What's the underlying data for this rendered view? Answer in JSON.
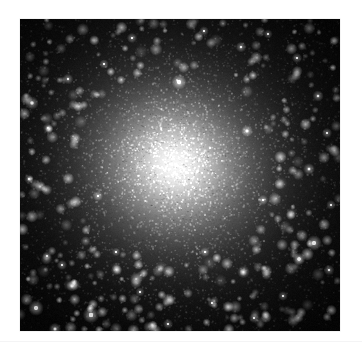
{
  "page": {
    "width": 362,
    "height": 353,
    "background_color": "#ffffff",
    "has_text": false,
    "has_axes": false,
    "has_border": false,
    "content_type": "astronomical-photograph"
  },
  "seam": {
    "y": 341,
    "color": "#f4f4f5"
  },
  "image_panel": {
    "name": "globular-cluster-image",
    "x": 20,
    "y": 19,
    "width": 320,
    "height": 312,
    "background_color": "#000000",
    "frame_color": "#e9e9ea"
  },
  "chart_data": {
    "type": "heatmap",
    "title": "",
    "subtitle": "",
    "xlabel": "",
    "ylabel": "",
    "legend": [],
    "grid": false,
    "colormap": "grayscale",
    "value_range": [
      0,
      255
    ],
    "cluster": {
      "center_x": 175,
      "center_y": 165,
      "core_radius_px": 22,
      "core_peak_value": 250,
      "halo_radius_px": 120,
      "background_value": 6,
      "ellipticity": 0.92,
      "position_angle_deg": 20,
      "profile": "king-like radial falloff",
      "radial_profile": {
        "radius_px": [
          0,
          10,
          20,
          30,
          45,
          60,
          80,
          100,
          125,
          150,
          180,
          220
        ],
        "brightness": [
          250,
          244,
          228,
          200,
          158,
          120,
          80,
          52,
          32,
          20,
          12,
          6
        ]
      }
    },
    "speckle": {
      "description": "fine granular unresolved-star texture modulating the smooth profile",
      "grain_count": 11000,
      "grain_size_px": [
        1,
        2
      ],
      "contrast": 0.55
    },
    "resolved_stars": [
      {
        "x": 36,
        "y": 308,
        "brightness": 235,
        "size": 3.0
      },
      {
        "x": 55,
        "y": 329,
        "brightness": 210,
        "size": 2.4
      },
      {
        "x": 91,
        "y": 315,
        "brightness": 245,
        "size": 3.2
      },
      {
        "x": 72,
        "y": 286,
        "brightness": 185,
        "size": 2.2
      },
      {
        "x": 62,
        "y": 265,
        "brightness": 175,
        "size": 2.0
      },
      {
        "x": 47,
        "y": 256,
        "brightness": 165,
        "size": 1.9
      },
      {
        "x": 32,
        "y": 103,
        "brightness": 200,
        "size": 2.6
      },
      {
        "x": 48,
        "y": 128,
        "brightness": 170,
        "size": 2.0
      },
      {
        "x": 29,
        "y": 179,
        "brightness": 160,
        "size": 1.9
      },
      {
        "x": 68,
        "y": 79,
        "brightness": 180,
        "size": 2.1
      },
      {
        "x": 104,
        "y": 64,
        "brightness": 155,
        "size": 1.8
      },
      {
        "x": 132,
        "y": 38,
        "brightness": 170,
        "size": 2.0
      },
      {
        "x": 179,
        "y": 82,
        "brightness": 225,
        "size": 2.9
      },
      {
        "x": 204,
        "y": 31,
        "brightness": 160,
        "size": 1.9
      },
      {
        "x": 241,
        "y": 47,
        "brightness": 175,
        "size": 2.1
      },
      {
        "x": 268,
        "y": 34,
        "brightness": 150,
        "size": 1.8
      },
      {
        "x": 297,
        "y": 58,
        "brightness": 165,
        "size": 2.0
      },
      {
        "x": 318,
        "y": 96,
        "brightness": 180,
        "size": 2.2
      },
      {
        "x": 327,
        "y": 133,
        "brightness": 170,
        "size": 2.0
      },
      {
        "x": 309,
        "y": 169,
        "brightness": 190,
        "size": 2.3
      },
      {
        "x": 331,
        "y": 205,
        "brightness": 160,
        "size": 1.9
      },
      {
        "x": 314,
        "y": 243,
        "brightness": 235,
        "size": 3.0
      },
      {
        "x": 299,
        "y": 259,
        "brightness": 205,
        "size": 2.5
      },
      {
        "x": 329,
        "y": 270,
        "brightness": 175,
        "size": 2.1
      },
      {
        "x": 283,
        "y": 296,
        "brightness": 160,
        "size": 1.9
      },
      {
        "x": 254,
        "y": 318,
        "brightness": 170,
        "size": 2.0
      },
      {
        "x": 212,
        "y": 303,
        "brightness": 155,
        "size": 1.8
      },
      {
        "x": 168,
        "y": 324,
        "brightness": 165,
        "size": 2.0
      },
      {
        "x": 140,
        "y": 292,
        "brightness": 150,
        "size": 1.8
      },
      {
        "x": 116,
        "y": 252,
        "brightness": 145,
        "size": 1.7
      },
      {
        "x": 247,
        "y": 131,
        "brightness": 200,
        "size": 2.3
      },
      {
        "x": 263,
        "y": 200,
        "brightness": 170,
        "size": 2.0
      },
      {
        "x": 98,
        "y": 196,
        "brightness": 175,
        "size": 2.0
      },
      {
        "x": 205,
        "y": 252,
        "brightness": 160,
        "size": 1.9
      }
    ]
  }
}
